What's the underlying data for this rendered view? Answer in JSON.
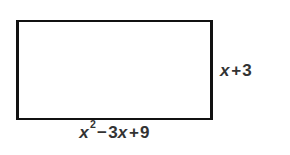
{
  "figure": {
    "type": "rectangle-diagram",
    "background_color": "#ffffff",
    "shape": {
      "name": "rectangle",
      "fill_color": "#ffffff",
      "stroke_color": "#111111"
    },
    "labels": {
      "height": {
        "full_text": "x + 3",
        "variable": "x",
        "operator": "+",
        "constant": "3",
        "position": "right"
      },
      "width": {
        "full_text": "x² − 3x + 9",
        "term1_variable": "x",
        "term1_exponent": "2",
        "operator1": "−",
        "term2_coefficient": "3",
        "term2_variable": "x",
        "operator2": "+",
        "term3_constant": "9",
        "position": "bottom"
      }
    },
    "text_color": "#333333"
  }
}
